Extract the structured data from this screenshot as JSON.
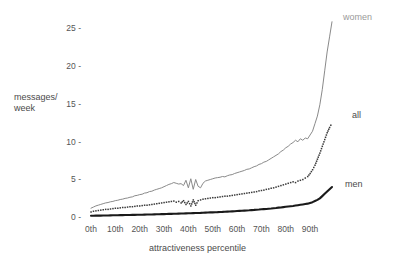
{
  "chart_data": {
    "type": "line",
    "title": "",
    "xlabel": "attractiveness percentile",
    "ylabel": "messages/\nweek",
    "ylabel_line1": "messages/",
    "ylabel_line2": "week",
    "xlim": [
      0,
      99
    ],
    "ylim": [
      0,
      26.5
    ],
    "grid": false,
    "legend_position": "right-inline",
    "x_tick_labels": [
      "0th",
      "10th",
      "20th",
      "30th",
      "40th",
      "50th",
      "60th",
      "70th",
      "80th",
      "90th"
    ],
    "x_tick_values": [
      0,
      10,
      20,
      30,
      40,
      50,
      60,
      70,
      80,
      90
    ],
    "y_tick_labels": [
      "0 -",
      "5 -",
      "10 -",
      "15 -",
      "20 -",
      "25 -"
    ],
    "y_tick_values": [
      0,
      5,
      10,
      15,
      20,
      25
    ],
    "colors": {
      "women": "#8a8a8a",
      "all": "#3a3a3a",
      "men": "#1a1a1a",
      "text": "#4a4a4a",
      "background": "#ffffff"
    },
    "series": [
      {
        "name": "women",
        "label": "women",
        "style": "solid-thin",
        "color": "#8a8a8a",
        "x": [
          0,
          1,
          2,
          3,
          4,
          5,
          6,
          7,
          8,
          9,
          10,
          11,
          12,
          13,
          14,
          15,
          16,
          17,
          18,
          19,
          20,
          21,
          22,
          23,
          24,
          25,
          26,
          27,
          28,
          29,
          30,
          31,
          32,
          33,
          34,
          35,
          36,
          37,
          38,
          39,
          40,
          41,
          42,
          43,
          44,
          45,
          46,
          47,
          48,
          49,
          50,
          51,
          52,
          53,
          54,
          55,
          56,
          57,
          58,
          59,
          60,
          61,
          62,
          63,
          64,
          65,
          66,
          67,
          68,
          69,
          70,
          71,
          72,
          73,
          74,
          75,
          76,
          77,
          78,
          79,
          80,
          81,
          82,
          83,
          84,
          85,
          86,
          87,
          88,
          89,
          90,
          91,
          92,
          93,
          94,
          95,
          96,
          97,
          98,
          99
        ],
        "values": [
          1.3,
          1.45,
          1.6,
          1.7,
          1.8,
          1.9,
          2.0,
          2.05,
          2.15,
          2.2,
          2.3,
          2.35,
          2.45,
          2.5,
          2.6,
          2.65,
          2.75,
          2.8,
          2.95,
          3.0,
          3.1,
          3.15,
          3.3,
          3.35,
          3.5,
          3.55,
          3.7,
          3.8,
          3.9,
          4.0,
          4.15,
          4.3,
          4.45,
          4.55,
          4.7,
          4.6,
          4.5,
          4.55,
          4.3,
          5.0,
          4.0,
          5.2,
          3.8,
          5.1,
          4.2,
          4.0,
          4.6,
          4.9,
          5.0,
          5.1,
          5.2,
          5.3,
          5.35,
          5.4,
          5.5,
          5.45,
          5.6,
          5.7,
          5.75,
          5.9,
          6.0,
          6.1,
          6.2,
          6.3,
          6.45,
          6.5,
          6.65,
          6.8,
          6.9,
          7.1,
          7.2,
          7.4,
          7.5,
          7.7,
          7.9,
          8.1,
          8.3,
          8.5,
          8.8,
          9.0,
          9.3,
          9.5,
          9.8,
          10.0,
          10.3,
          10.1,
          10.5,
          10.3,
          10.6,
          10.5,
          11.0,
          11.5,
          12.5,
          13.5,
          15.0,
          17.0,
          19.5,
          22.0,
          24.0,
          26.0
        ]
      },
      {
        "name": "all",
        "label": "all",
        "style": "dotted",
        "color": "#3a3a3a",
        "x": [
          0,
          1,
          2,
          3,
          4,
          5,
          6,
          7,
          8,
          9,
          10,
          11,
          12,
          13,
          14,
          15,
          16,
          17,
          18,
          19,
          20,
          21,
          22,
          23,
          24,
          25,
          26,
          27,
          28,
          29,
          30,
          31,
          32,
          33,
          34,
          35,
          36,
          37,
          38,
          39,
          40,
          41,
          42,
          43,
          44,
          45,
          46,
          47,
          48,
          49,
          50,
          51,
          52,
          53,
          54,
          55,
          56,
          57,
          58,
          59,
          60,
          61,
          62,
          63,
          64,
          65,
          66,
          67,
          68,
          69,
          70,
          71,
          72,
          73,
          74,
          75,
          76,
          77,
          78,
          79,
          80,
          81,
          82,
          83,
          84,
          85,
          86,
          87,
          88,
          89,
          90,
          91,
          92,
          93,
          94,
          95,
          96,
          97,
          98,
          99
        ],
        "values": [
          0.8,
          0.9,
          0.95,
          1.0,
          1.05,
          1.1,
          1.15,
          1.15,
          1.2,
          1.25,
          1.3,
          1.3,
          1.35,
          1.4,
          1.4,
          1.45,
          1.5,
          1.5,
          1.55,
          1.6,
          1.6,
          1.65,
          1.7,
          1.7,
          1.75,
          1.8,
          1.85,
          1.9,
          1.95,
          2.0,
          2.05,
          2.1,
          2.15,
          2.2,
          2.25,
          2.1,
          2.2,
          2.0,
          2.3,
          1.8,
          2.2,
          1.6,
          2.4,
          1.7,
          2.3,
          2.4,
          2.5,
          2.55,
          2.6,
          2.65,
          2.7,
          2.7,
          2.75,
          2.8,
          2.85,
          2.9,
          2.9,
          2.95,
          3.0,
          3.05,
          3.1,
          3.15,
          3.2,
          3.25,
          3.3,
          3.35,
          3.4,
          3.45,
          3.5,
          3.6,
          3.65,
          3.7,
          3.8,
          3.85,
          3.95,
          4.0,
          4.1,
          4.2,
          4.3,
          4.4,
          4.5,
          4.6,
          4.7,
          4.8,
          4.7,
          4.9,
          5.0,
          5.1,
          5.3,
          5.5,
          5.9,
          6.4,
          7.0,
          7.8,
          8.6,
          9.5,
          10.4,
          11.3,
          12.0,
          12.6
        ]
      },
      {
        "name": "men",
        "label": "men",
        "style": "solid-thick",
        "color": "#1a1a1a",
        "x": [
          0,
          1,
          2,
          3,
          4,
          5,
          6,
          7,
          8,
          9,
          10,
          11,
          12,
          13,
          14,
          15,
          16,
          17,
          18,
          19,
          20,
          21,
          22,
          23,
          24,
          25,
          26,
          27,
          28,
          29,
          30,
          31,
          32,
          33,
          34,
          35,
          36,
          37,
          38,
          39,
          40,
          41,
          42,
          43,
          44,
          45,
          46,
          47,
          48,
          49,
          50,
          51,
          52,
          53,
          54,
          55,
          56,
          57,
          58,
          59,
          60,
          61,
          62,
          63,
          64,
          65,
          66,
          67,
          68,
          69,
          70,
          71,
          72,
          73,
          74,
          75,
          76,
          77,
          78,
          79,
          80,
          81,
          82,
          83,
          84,
          85,
          86,
          87,
          88,
          89,
          90,
          91,
          92,
          93,
          94,
          95,
          96,
          97,
          98,
          99
        ],
        "values": [
          0.3,
          0.3,
          0.31,
          0.32,
          0.32,
          0.33,
          0.34,
          0.34,
          0.35,
          0.36,
          0.36,
          0.37,
          0.38,
          0.38,
          0.39,
          0.4,
          0.4,
          0.41,
          0.42,
          0.43,
          0.43,
          0.44,
          0.45,
          0.46,
          0.46,
          0.47,
          0.48,
          0.49,
          0.5,
          0.51,
          0.52,
          0.53,
          0.54,
          0.55,
          0.56,
          0.57,
          0.58,
          0.59,
          0.6,
          0.61,
          0.62,
          0.63,
          0.65,
          0.66,
          0.67,
          0.68,
          0.7,
          0.71,
          0.72,
          0.74,
          0.75,
          0.77,
          0.78,
          0.8,
          0.81,
          0.83,
          0.85,
          0.86,
          0.88,
          0.9,
          0.92,
          0.94,
          0.96,
          0.98,
          1.0,
          1.02,
          1.05,
          1.07,
          1.1,
          1.12,
          1.15,
          1.18,
          1.2,
          1.23,
          1.26,
          1.3,
          1.33,
          1.37,
          1.4,
          1.44,
          1.48,
          1.52,
          1.56,
          1.6,
          1.65,
          1.7,
          1.75,
          1.8,
          1.85,
          1.9,
          2.0,
          2.1,
          2.25,
          2.4,
          2.6,
          2.9,
          3.2,
          3.5,
          3.8,
          4.1
        ]
      }
    ]
  },
  "labels": {
    "women": "women",
    "all": "all",
    "men": "men"
  },
  "axis": {
    "y_title_line1": "messages/",
    "y_title_line2": "week",
    "x_title": "attractiveness percentile"
  }
}
